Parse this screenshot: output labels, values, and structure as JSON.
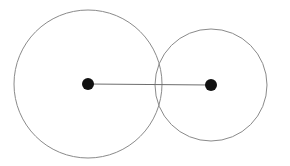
{
  "figure": {
    "title": "Two overlapping circles with centers joined by a line segment",
    "canvas": {
      "width": 290,
      "height": 166,
      "background_color": "#ffffff"
    },
    "style": {
      "circle_stroke_color": "#8a8a8a",
      "circle_stroke_width": 1,
      "circle_fill": "none",
      "dot_color": "#111111",
      "line_color": "#6e6e6e",
      "line_width": 1.2
    },
    "shapes": {
      "left_circle": {
        "label": "left circle",
        "center_x": 88,
        "center_y": 84,
        "radius": 74
      },
      "right_circle": {
        "label": "right circle",
        "center_x": 211,
        "center_y": 85,
        "radius": 56
      },
      "left_center_dot": {
        "label": "left center point",
        "center_x": 88,
        "center_y": 84,
        "radius": 6
      },
      "right_center_dot": {
        "label": "right center point",
        "center_x": 211,
        "center_y": 85,
        "radius": 6
      },
      "center_connector": {
        "label": "segment joining the two centers",
        "x1": 88,
        "y1": 84,
        "x2": 211,
        "y2": 85
      }
    }
  }
}
